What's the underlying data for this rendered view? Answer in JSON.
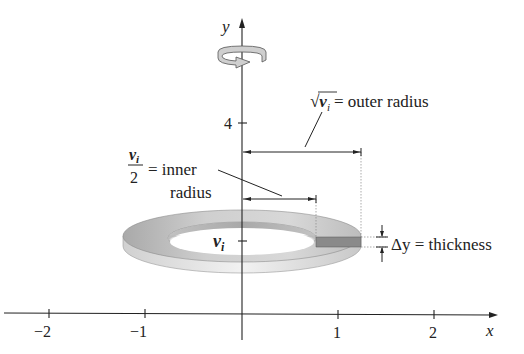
{
  "figure": {
    "axes": {
      "x_label": "x",
      "y_label": "y",
      "x_ticks": [
        "−2",
        "−1",
        "1",
        "2"
      ],
      "y_tick_4": "4",
      "y_tick_vi": "v",
      "y_tick_vi_sub": "i"
    },
    "annotations": {
      "outer_radius_expr": "√v",
      "outer_radius_sub": "i",
      "outer_radius_text": "= outer radius",
      "inner_radius_num": "v",
      "inner_radius_num_sub": "i",
      "inner_radius_den": "2",
      "inner_radius_text_1": "= inner",
      "inner_radius_text_2": "radius",
      "thickness_text": "Δy = thickness"
    },
    "rotation_icon": "rotation-arrow-icon",
    "colors": {
      "ring_top": "#c9c9c9",
      "ring_side": "#e6e6e6",
      "slice": "#8a8a8a",
      "axis": "#222222"
    }
  }
}
